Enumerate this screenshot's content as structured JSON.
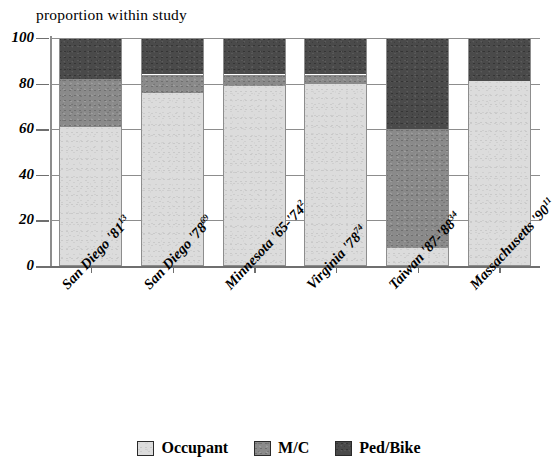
{
  "chart_data": {
    "type": "bar",
    "subtype": "stacked-bar-100-percent",
    "title": "proportion within study",
    "xlabel": "",
    "ylabel": "",
    "ylim": [
      0,
      100
    ],
    "yticks": [
      0,
      20,
      40,
      60,
      80,
      100
    ],
    "grid": true,
    "legend_position": "bottom-center",
    "categories": [
      "San Diego '81",
      "San Diego '78",
      "Minnesota '65-'74",
      "Virginia '78",
      "Taiwan '87-'88",
      "Massachusetts '90"
    ],
    "category_refs": [
      "13",
      "69",
      "2",
      "74",
      "34",
      "11"
    ],
    "series": [
      {
        "name": "Occupant",
        "color": "#dcdcdc",
        "values": [
          61,
          76,
          79,
          80,
          8,
          81
        ]
      },
      {
        "name": "M/C",
        "color": "#8a8a8a",
        "values": [
          21,
          8,
          5,
          4,
          52,
          0
        ]
      },
      {
        "name": "Ped/Bike",
        "color": "#4a4a4a",
        "values": [
          18,
          16,
          16,
          16,
          40,
          19
        ]
      }
    ],
    "cumulative_tops": [
      {
        "category": "San Diego '81",
        "occupant_top": 61,
        "mc_top": 82,
        "pedbike_top": 100
      },
      {
        "category": "San Diego '78",
        "occupant_top": 76,
        "mc_top": 84,
        "pedbike_top": 100
      },
      {
        "category": "Minnesota '65-'74",
        "occupant_top": 79,
        "mc_top": 84,
        "pedbike_top": 100
      },
      {
        "category": "Virginia '78",
        "occupant_top": 80,
        "mc_top": 84,
        "pedbike_top": 100
      },
      {
        "category": "Taiwan '87-'88",
        "occupant_top": 8,
        "mc_top": 60,
        "pedbike_top": 100
      },
      {
        "category": "Massachusetts '90",
        "occupant_top": 81,
        "mc_top": 81,
        "pedbike_top": 100
      }
    ]
  },
  "axis": {
    "y_tick_labels": [
      "100",
      "80",
      "60",
      "40",
      "20",
      "0"
    ]
  },
  "legend": {
    "items": [
      {
        "label": "Occupant",
        "color": "#dcdcdc"
      },
      {
        "label": "M/C",
        "color": "#8a8a8a"
      },
      {
        "label": "Ped/Bike",
        "color": "#4a4a4a"
      }
    ]
  },
  "x_labels": [
    {
      "text": "San Diego '81",
      "ref": "13"
    },
    {
      "text": "San Diego '78",
      "ref": "69"
    },
    {
      "text": "Minnesota '65-'74",
      "ref": "2"
    },
    {
      "text": "Virginia '78",
      "ref": "74"
    },
    {
      "text": "Taiwan '87-'88",
      "ref": "34"
    },
    {
      "text": "Massachusetts '90",
      "ref": "11"
    }
  ]
}
